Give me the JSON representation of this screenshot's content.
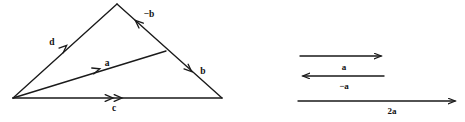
{
  "figure": {
    "background_color": "#ffffff",
    "stroke_color": "#1a1a1a",
    "text_color": "#111111",
    "width": 465,
    "height": 122
  },
  "triangle_panel": {
    "name": "vector-triangle-diagram",
    "vertices": {
      "left": [
        13,
        98
      ],
      "apex": [
        117,
        4
      ],
      "right": [
        222,
        98
      ]
    },
    "labels": {
      "d": "d",
      "minus_b": "−b",
      "b": "b",
      "a": "a",
      "c": "c"
    },
    "edges": [
      {
        "name": "d-edge",
        "label": "d",
        "from": [
          13,
          98
        ],
        "to": [
          117,
          4
        ],
        "arrow": "mid-forward"
      },
      {
        "name": "minus-b-edge",
        "label": "−b",
        "from": [
          165,
          52
        ],
        "to": [
          117,
          4
        ],
        "arrow": "mid-forward"
      },
      {
        "name": "b-edge",
        "label": "b",
        "from": [
          117,
          4
        ],
        "to": [
          222,
          98
        ],
        "arrow": "mid-forward"
      },
      {
        "name": "a-edge",
        "label": "a",
        "from": [
          13,
          98
        ],
        "to": [
          165,
          52
        ],
        "arrow": "mid-forward"
      },
      {
        "name": "c-edge",
        "label": "c",
        "from": [
          13,
          98
        ],
        "to": [
          222,
          98
        ],
        "arrow": "mid-double-forward"
      }
    ]
  },
  "vectors_panel": {
    "name": "scalar-multiple-vectors",
    "rows": [
      {
        "name": "vector-a",
        "label": "a",
        "direction": "right",
        "from": [
          300,
          56
        ],
        "to": [
          384,
          56
        ],
        "label_pos": [
          344,
          70
        ]
      },
      {
        "name": "vector-minus-a",
        "label": "−a",
        "direction": "left",
        "from": [
          384,
          76
        ],
        "to": [
          300,
          76
        ],
        "label_pos": [
          344,
          89
        ]
      },
      {
        "name": "vector-2a",
        "label": "2a",
        "direction": "right",
        "from": [
          298,
          101
        ],
        "to": [
          458,
          101
        ],
        "label_pos": [
          392,
          114
        ]
      }
    ]
  }
}
